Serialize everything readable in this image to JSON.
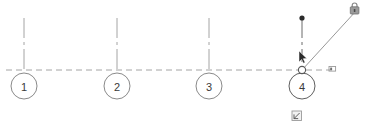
{
  "canvas": {
    "name": "grid-plan-canvas",
    "background_color": "#ffffff",
    "width": 375,
    "height": 132
  },
  "style": {
    "grid_line_color": "#9a9a9a",
    "bubble_stroke_color": "#7d7d7d",
    "bubble_fill_color": "#ffffff",
    "bubble_text_color": "#3a3a3a",
    "selected_color": "#4a4a4a",
    "drag_line_color": "#8c8c8c",
    "grip_fill_color": "#ffffff",
    "grip_stroke_color": "#6b6b6b",
    "cursor_color": "#2b2b2b",
    "lock_icon_color": "#8a8a8a",
    "snap_icon_color": "#8a8a8a"
  },
  "gridline": {
    "name": "horizontal-gridline",
    "orientation": "horizontal",
    "y": 70,
    "x_start": 6,
    "x_end": 332,
    "dash_pattern": "6,4"
  },
  "grid_bubbles": [
    {
      "label": "1",
      "cx": 24,
      "cy": 86,
      "r": 13,
      "stem_top": 18,
      "selected": false
    },
    {
      "label": "2",
      "cx": 117,
      "cy": 86,
      "r": 13,
      "stem_top": 18,
      "selected": false
    },
    {
      "label": "3",
      "cx": 209,
      "cy": 86,
      "r": 13,
      "stem_top": 18,
      "selected": false
    },
    {
      "label": "4",
      "cx": 302,
      "cy": 86,
      "r": 13,
      "stem_top": 18,
      "selected": true
    }
  ],
  "selection": {
    "active_bubble_label": "4",
    "grip_point": {
      "name": "drag-grip-point",
      "cx": 302,
      "cy": 70,
      "r": 3.5
    },
    "end_grip_dot": {
      "name": "endpoint-grip-dot",
      "cx": 302,
      "cy": 18,
      "r": 2.6
    },
    "drag_line": {
      "name": "drag-rubber-band-line",
      "x1": 302,
      "y1": 70,
      "x2": 356,
      "y2": 11
    }
  },
  "cursor": {
    "name": "move-cursor",
    "x": 301,
    "y": 53,
    "kind": "arrow-pointer"
  },
  "icons": {
    "lock": {
      "name": "padlock-icon",
      "x": 350,
      "y": 3,
      "width": 11,
      "height": 12,
      "state": "locked",
      "glyph": "lock"
    },
    "snap_marker": {
      "name": "snap-point-marker",
      "x": 329,
      "y": 66,
      "width": 7,
      "height": 5,
      "glyph": "snap-square"
    },
    "status_square": {
      "name": "drag-status-icon",
      "x": 292,
      "y": 111,
      "width": 10,
      "height": 10,
      "glyph": "small-square-marker"
    }
  }
}
